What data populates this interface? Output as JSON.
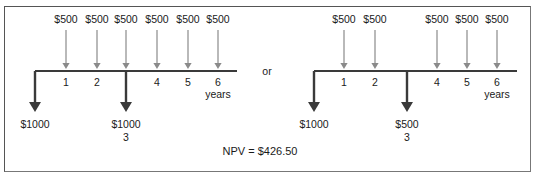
{
  "diagrams": [
    {
      "name": "left",
      "origin_x": 35,
      "axis_end_x": 237,
      "axis_y": 71,
      "period_x": [
        35,
        66,
        97,
        126,
        157,
        188,
        218
      ],
      "inflows": [
        {
          "period": 1,
          "label": "$500"
        },
        {
          "period": 2,
          "label": "$500"
        },
        {
          "period": 3,
          "label": "$500"
        },
        {
          "period": 4,
          "label": "$500"
        },
        {
          "period": 5,
          "label": "$500"
        },
        {
          "period": 6,
          "label": "$500"
        }
      ],
      "outflows": [
        {
          "period": 0,
          "label": "$1000"
        },
        {
          "period": 3,
          "label": "$1000"
        }
      ],
      "period_labels": [
        "1",
        "2",
        "3",
        "4",
        "5",
        "6"
      ],
      "unit_label": "years"
    },
    {
      "name": "right",
      "origin_x": 314,
      "axis_end_x": 517,
      "axis_y": 71,
      "period_x": [
        314,
        344,
        375,
        407,
        437,
        467,
        497
      ],
      "inflows": [
        {
          "period": 1,
          "label": "$500"
        },
        {
          "period": 2,
          "label": "$500"
        },
        {
          "period": 4,
          "label": "$500"
        },
        {
          "period": 5,
          "label": "$500"
        },
        {
          "period": 6,
          "label": "$500"
        }
      ],
      "outflows": [
        {
          "period": 0,
          "label": "$1000"
        },
        {
          "period": 3,
          "label": "$500"
        }
      ],
      "period_labels": [
        "1",
        "2",
        "3",
        "4",
        "5",
        "6"
      ],
      "unit_label": "years"
    }
  ],
  "connector_label": "or",
  "npv_label": "NPV  =  $426.50",
  "colors": {
    "axis": "#3a3a3a",
    "inflow_arrow": "#8a8a8a",
    "outflow_arrow": "#3a3a3a"
  }
}
